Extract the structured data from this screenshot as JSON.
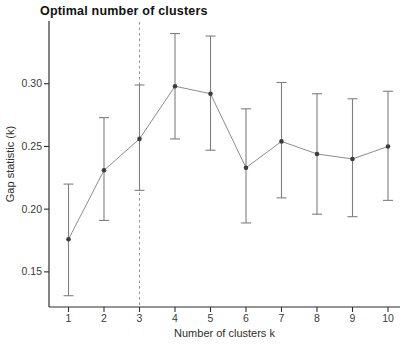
{
  "chart_data": {
    "type": "line",
    "title": "Optimal number of clusters",
    "xlabel": "Number of clusters k",
    "ylabel": "Gap statistic (k)",
    "x": [
      1,
      2,
      3,
      4,
      5,
      6,
      7,
      8,
      9,
      10
    ],
    "x_tick_labels": [
      "1",
      "2",
      "3",
      "4",
      "5",
      "6",
      "7",
      "8",
      "9",
      "10"
    ],
    "series": [
      {
        "name": "Gap statistic",
        "values": [
          0.176,
          0.231,
          0.256,
          0.298,
          0.292,
          0.233,
          0.254,
          0.244,
          0.24,
          0.25
        ],
        "error_low": [
          0.131,
          0.191,
          0.215,
          0.256,
          0.247,
          0.189,
          0.209,
          0.196,
          0.194,
          0.207
        ],
        "error_high": [
          0.22,
          0.273,
          0.299,
          0.34,
          0.338,
          0.28,
          0.301,
          0.292,
          0.288,
          0.294
        ]
      }
    ],
    "y_ticks": [
      0.15,
      0.2,
      0.25,
      0.3
    ],
    "y_tick_labels": [
      "0.15",
      "0.20",
      "0.25",
      "0.30"
    ],
    "ylim": [
      0.122,
      0.35
    ],
    "optimal_k_dashed_line": 3,
    "grid": false,
    "legend": "none",
    "colors": {
      "series_line": "#8c8c8c",
      "point": "#3d3d3d",
      "error_bar": "#7f7f7f",
      "dashed_line": "#919191",
      "axis": "#2f2f2f",
      "tick_text": "#3a3a3a"
    }
  }
}
